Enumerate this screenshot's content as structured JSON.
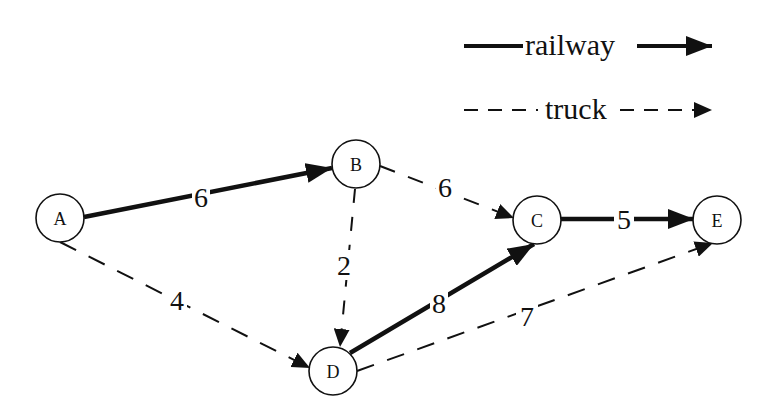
{
  "legend": {
    "railway_label": "railway",
    "truck_label": "truck"
  },
  "nodes": [
    {
      "id": "A",
      "label": "A",
      "x": 60,
      "y": 218
    },
    {
      "id": "B",
      "label": "B",
      "x": 356,
      "y": 164
    },
    {
      "id": "C",
      "label": "C",
      "x": 537,
      "y": 220
    },
    {
      "id": "D",
      "label": "D",
      "x": 333,
      "y": 371
    },
    {
      "id": "E",
      "label": "E",
      "x": 717,
      "y": 220
    }
  ],
  "edges": [
    {
      "from": "A",
      "to": "B",
      "weight": "6",
      "mode": "railway"
    },
    {
      "from": "A",
      "to": "D",
      "weight": "4",
      "mode": "truck"
    },
    {
      "from": "B",
      "to": "C",
      "weight": "6",
      "mode": "truck"
    },
    {
      "from": "B",
      "to": "D",
      "weight": "2",
      "mode": "truck"
    },
    {
      "from": "D",
      "to": "C",
      "weight": "8",
      "mode": "railway"
    },
    {
      "from": "C",
      "to": "E",
      "weight": "5",
      "mode": "railway"
    },
    {
      "from": "D",
      "to": "E",
      "weight": "7",
      "mode": "truck"
    }
  ],
  "colors": {
    "stroke": "#111111",
    "background": "#ffffff"
  }
}
